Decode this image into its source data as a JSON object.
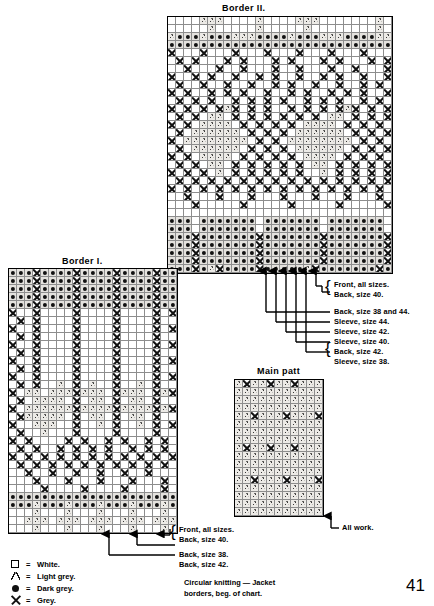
{
  "page": {
    "number": "41",
    "caption_line1": "Circular knitting — Jacket",
    "caption_line2": "borders, beg. of chart."
  },
  "legend": {
    "items": [
      {
        "symbol": "square-outline-icon",
        "eq": "=",
        "label": "White."
      },
      {
        "symbol": "v-glyph-icon",
        "eq": "=",
        "label": "Light grey."
      },
      {
        "symbol": "filled-dot-icon",
        "eq": "=",
        "label": "Dark grey."
      },
      {
        "symbol": "x-cross-icon",
        "eq": "=",
        "label": "Grey."
      }
    ]
  },
  "charts": {
    "border2": {
      "title": "Border II.",
      "cols": 28,
      "rows": 32,
      "cell": 8,
      "annotations": [
        "Front, all sizes.",
        "Back, size 40.",
        "Back, size 38 and 44.",
        "Sleeve, size 44.",
        "Sleeve, size 42.",
        "Sleeve, size 40.",
        "Back, size 42.",
        "Sleeve, size 38."
      ],
      "rows_data": [
        "WWWWVVVWWWWVWWWWVVVWWWWWWWVW",
        "WWWWWVWWWWWVWWWWWVWWWWWWWWVW",
        "VDDDVDDDVVVDDDDVDDDVVVDDDDVV",
        "DDDDDDDDDDDDDDDDDDDDDDDDDDDD",
        "XWWWXWWWXWWWXWWWXWWWXWWWXWWW",
        "WXWXWWWXWXWWWXWXWWWXWXWWWXWX",
        "WWXWWWXWWXWWWXWWXWWWXWWXWWWX",
        "XWWXWXWWXWWXWXWWXWWXWXWWXWWX",
        "WXWWXWWXWWXWWXWXWWXWWXWWXWXW",
        "XWXWWXWXWXWWXWWXWXWWXWXWXWWX",
        "WXWXWXWWXWXWXWXWWXWXWXWWXWXW",
        "XWXWXWXVXWXWXWWXWXWXWXVXWXWX",
        "WXWXWVVWXWXWXWXWXWXWVVWXWXWX",
        "XWXWVVVVWXWXWXWXWVVVVWXWXWXW",
        "WXWVVVVVVWXWXWXWVVVVVVWXWXWX",
        "XWVVVVVVVVWXWXWVVVVVVVVWXWXW",
        "WXWVVVVVVWXWXWXWVVVVVVWXWXWX",
        "XWXWVVVVWXWXWXWXWVVVVWXWXWXW",
        "WXWXWVVWXWXWXWXWXWVVWXWXWXWX",
        "XWXWXWVWXWXWXWXWXWWVWXWXWXWX",
        "WXWXWXWXWXWXWXWXWXWXWXWXWXWX",
        "XWXWXWXWXWXWXWXWXWXWXWXWXWXW",
        "WWXWWWXWWWXWWWXWWWXWWWXWWWXW",
        "WWWXWWWWWXWWWWWXWWWWWXWWWWWX",
        "WWWWWWWWWWWWWWWWWWWWWWWWWWWW",
        "DDDWDDDDDDDWDDDDDDDWDDDDDDDW",
        "DDDWDDDDDDDWDDDDDDDWDDDDDDDW",
        "DDDXDDDDDDDXDDDDDDDXDDDDDDDX",
        "DDDXDDDDDDDXDDDDDDDXDDDDDDDX",
        "DDDXDDDDDDDXDDDDDDDXDDDDDDDX",
        "DDDXDDDDDDDXDDDDDDDXDDDDDDDX",
        "DDDXDVXDDDDXDDDDDVXDDDDDDDXD"
      ]
    },
    "border1": {
      "title": "Border I.",
      "cols": 21,
      "rows": 33,
      "cell": 8,
      "annotations": [
        "Front, all sizes.",
        "Back, size 40.",
        "Back, size 38.",
        "Back, size 42."
      ],
      "rows_data": [
        "DDDXDDDDXDDDDXDDDDXDD",
        "DDDXDDDDXDDDDXDDDDXDD",
        "DDDXDDDDXDDDDXDDDDXDD",
        "DDDXDDDDXDDDDXDDDDXDD",
        "DDDXDDDDXDDDDXDDDDXDD",
        "XWWXWWWWXWWWWXWWWWXWX",
        "WXWXWWWWXWWWWXWWWWXWW",
        "XWWXWWWWXWWWWXWWWWXWX",
        "WXWXWWWWXWWWWXWWWWXWW",
        "XWWXWWWWXWWWWXWWWWXWX",
        "WXWXWWWWXWWWWXWWWWXWW",
        "XWWXWWWWXWWWWXWWWWXWX",
        "WXWXWWWWXWWWWXWWWWXWW",
        "XWWXWWWWXWWWWXWWWWXWX",
        "WXWXWWVWXWVWWXWWVWXWW",
        "XWVVWVVVXVVVWXVVVWXVX",
        "WXWVVVVWXWVVWXWVVWXWW",
        "XWVVVVVVXVVVVXVVVVXVX",
        "WXVVVVVWXWVVWXWVVWXWW",
        "XWWVVVWWXWWVWXWWVWXWX",
        "WXWWVWWWXWWWWXWWWWXWW",
        "XWXWWWWXWXWWXWXWWXWXW",
        "WXWXWWXWXWXWXWWXWXWXW",
        "XWXWXWXWXWXWXWXWXWXWX",
        "WXWXWXWXWXWXWXWXWXWXW",
        "WWXWWXWWXWWXWWXWWXWWW",
        "WWWXWWWXWWWXWWWXWWWXW",
        "WWWWXWWWWXWWWWXWWWWXW",
        "DDDDDDDDDDDDDDDDDDDDD",
        "DDDVDDDVDDDVDDDVDDDVD",
        "WWWVWWWVWWWVWWWVWWWVW",
        "WWVVVWVVVWVVVWVVVWVVV",
        "WWWVWWWVWWWVWWWVWWWVW"
      ]
    },
    "mainpatt": {
      "title": "Main patt",
      "cols": 11,
      "rows": 17,
      "cell": 8,
      "annotation": "All work.",
      "rows_data": [
        "VXVVXVVXVVV",
        "VVVVVVVVVVV",
        "VVVVVVVVVVV",
        "VVVVVVVVVVV",
        "VVXVVVXVVVX",
        "VVVVVVVVVVV",
        "VVVVVVVVVVV",
        "VVVVVVVVVVV",
        "VXVVXVVXVVV",
        "VVVVVVVVVVV",
        "VVVVVVVVVVV",
        "VVVVVVVVVVV",
        "VVXVVVXVVVX",
        "VVVVVVVVVVV",
        "VVVVVVVVVVV",
        "VVVVVVVVVVV",
        "VVVVVVVVVVV"
      ]
    }
  }
}
